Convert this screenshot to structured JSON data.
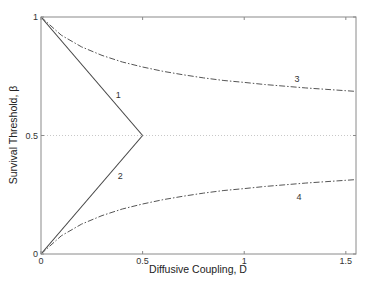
{
  "chart_data": {
    "type": "line",
    "title": "",
    "xlabel": "Diffusive Coupling, D",
    "ylabel": "Survival Threshold, β",
    "xlim": [
      0,
      1.55
    ],
    "ylim": [
      0,
      1
    ],
    "xticks": [
      0,
      0.5,
      1,
      1.5
    ],
    "xtick_labels": [
      "0",
      "0.5",
      "1",
      "1.5"
    ],
    "yticks": [
      0,
      0.5,
      1
    ],
    "ytick_labels": [
      "0",
      "0.5",
      "1"
    ],
    "grid": false,
    "reference_line": {
      "y": 0.5,
      "style": "dotted",
      "color": "#c8c8c8"
    },
    "series": [
      {
        "name": "1",
        "style": "solid",
        "color": "#444444",
        "x": [
          0,
          0.5
        ],
        "y": [
          1,
          0.5
        ],
        "label_pos": [
          0.38,
          0.67
        ]
      },
      {
        "name": "2",
        "style": "solid",
        "color": "#444444",
        "x": [
          0,
          0.5
        ],
        "y": [
          0,
          0.5
        ],
        "label_pos": [
          0.39,
          0.33
        ]
      },
      {
        "name": "3",
        "style": "dashdot",
        "color": "#555555",
        "x": [
          0,
          0.1,
          0.2,
          0.3,
          0.4,
          0.5,
          0.6,
          0.7,
          0.8,
          0.9,
          1.0,
          1.1,
          1.2,
          1.3,
          1.4,
          1.5,
          1.55
        ],
        "y": [
          1.0,
          0.923,
          0.874,
          0.838,
          0.81,
          0.789,
          0.771,
          0.756,
          0.743,
          0.732,
          0.724,
          0.715,
          0.708,
          0.701,
          0.695,
          0.689,
          0.686
        ],
        "label_pos": [
          1.26,
          0.74
        ]
      },
      {
        "name": "4",
        "style": "dashdot",
        "color": "#555555",
        "x": [
          0,
          0.1,
          0.2,
          0.3,
          0.4,
          0.5,
          0.6,
          0.7,
          0.8,
          0.9,
          1.0,
          1.1,
          1.2,
          1.3,
          1.4,
          1.5,
          1.55
        ],
        "y": [
          0.0,
          0.077,
          0.126,
          0.162,
          0.19,
          0.211,
          0.229,
          0.244,
          0.257,
          0.268,
          0.276,
          0.285,
          0.292,
          0.299,
          0.305,
          0.311,
          0.314
        ],
        "label_pos": [
          1.27,
          0.24
        ]
      }
    ]
  },
  "colors": {
    "axes": "#8a8a8a",
    "text": "#333333",
    "background": "#ffffff"
  }
}
